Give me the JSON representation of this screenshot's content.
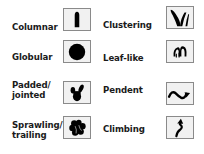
{
  "legend": {
    "title": "Cactus growth forms",
    "items": [
      {
        "id": "columnar",
        "label": "Columnar",
        "icon": "columnar-icon"
      },
      {
        "id": "clustering",
        "label": "Clustering",
        "icon": "clustering-icon"
      },
      {
        "id": "globular",
        "label": "Globular",
        "icon": "globular-icon"
      },
      {
        "id": "leaflike",
        "label": "Leaf-like",
        "icon": "leaf-like-icon"
      },
      {
        "id": "padded",
        "label_line1": "Padded/",
        "label_line2": "jointed",
        "icon": "padded-jointed-icon"
      },
      {
        "id": "pendent",
        "label": "Pendent",
        "icon": "pendent-icon"
      },
      {
        "id": "sprawling",
        "label_line1": "Sprawling/",
        "label_line2": "trailing",
        "icon": "sprawling-trailing-icon"
      },
      {
        "id": "climbing",
        "label": "Climbing",
        "icon": "climbing-icon"
      }
    ]
  },
  "colors": {
    "icon_fill": "#000000",
    "box_bg": "#f1f1f1",
    "box_border": "#8a8a8a",
    "text": "#1a1a1a"
  }
}
